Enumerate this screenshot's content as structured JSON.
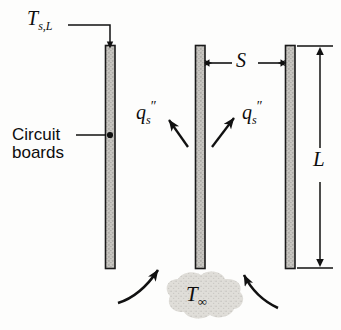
{
  "figure": {
    "background_color": "#fdfdfc",
    "ink_color": "#111111",
    "plate_fill_color": "#c9c7c2",
    "cloud_fill_color": "#d8d7d2"
  },
  "labels": {
    "surface_temperature": {
      "symbol": "T",
      "subscript": "s,L",
      "name": "T_s,L"
    },
    "circuit_boards": {
      "line1": "Circuit",
      "line2": "boards"
    },
    "spacing": {
      "symbol": "S",
      "name": "S"
    },
    "length": {
      "symbol": "L",
      "name": "L"
    },
    "ambient_temperature": {
      "symbol": "T",
      "subscript": "∞",
      "name": "T_infinity"
    },
    "heat_flux_left": {
      "symbol": "q",
      "subscript": "s",
      "superscript": "″",
      "name": "q_s_double_prime"
    },
    "heat_flux_right": {
      "symbol": "q",
      "subscript": "s",
      "superscript": "″",
      "name": "q_s_double_prime"
    }
  },
  "geometry": {
    "plates": [
      {
        "name": "left-circuit-board",
        "x": 105,
        "y": 45,
        "width": 10,
        "height": 224
      },
      {
        "name": "middle-circuit-board",
        "x": 195,
        "y": 45,
        "width": 10,
        "height": 224
      },
      {
        "name": "right-circuit-board",
        "x": 285,
        "y": 45,
        "width": 10,
        "height": 224
      }
    ],
    "dimension_s": {
      "from_x": 206,
      "to_x": 284,
      "y": 63
    },
    "dimension_l": {
      "x": 320,
      "top_y": 46,
      "bottom_y": 268
    }
  }
}
